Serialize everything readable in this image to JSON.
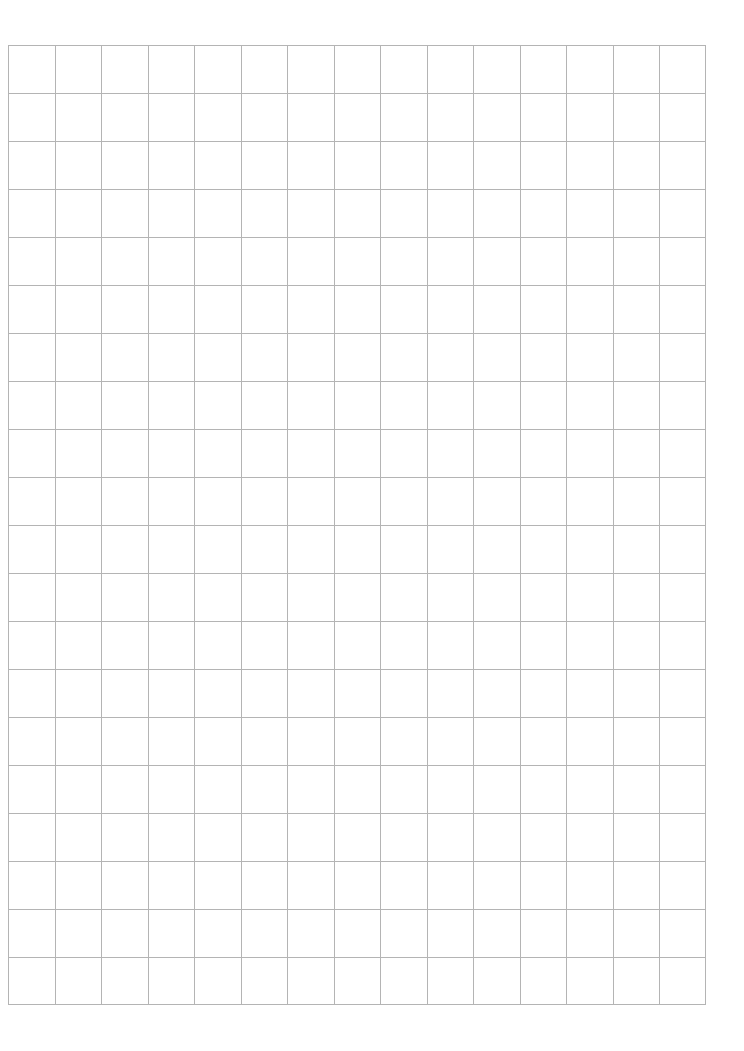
{
  "page": {
    "type": "grid-paper",
    "background_color": "#ffffff",
    "line_color": "#b4b4b4"
  },
  "grid": {
    "columns": 15,
    "rows": 20,
    "left": 8,
    "top": 45,
    "width": 698,
    "height": 960
  }
}
